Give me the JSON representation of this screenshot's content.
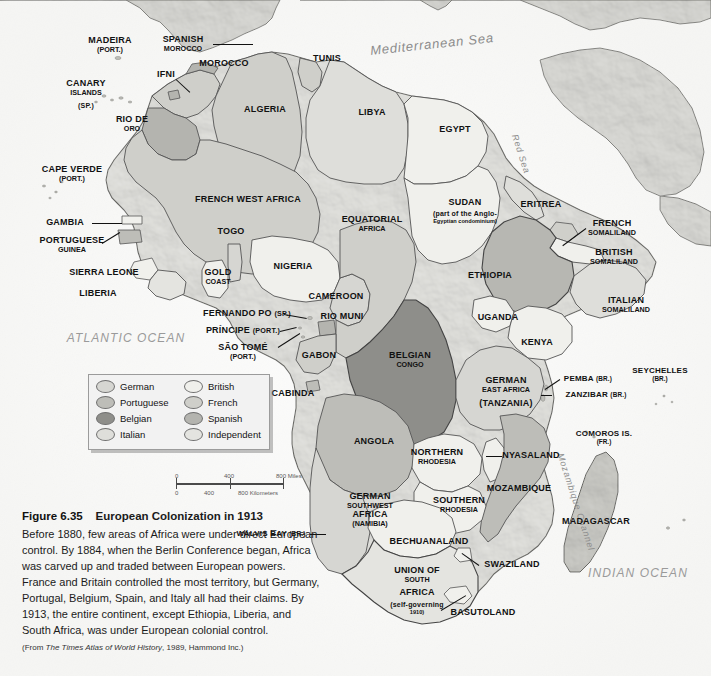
{
  "figure": {
    "number": "Figure 6.35",
    "title": "European Colonization in 1913",
    "body": "Before 1880, few areas of Africa were under direct European control. By 1884, when the Berlin Conference began, Africa was carved up and traded between European powers. France and Britain controlled the most territory, but Germany, Portugal, Belgium, Spain, and Italy all had their claims. By 1913, the entire continent, except Ethiopia, Liberia, and South Africa, was under European colonial control.",
    "source_prefix": "(From ",
    "source_italic": "The Times Atlas of World History",
    "source_suffix": ", 1989, Hammond Inc.)"
  },
  "legend": {
    "items": [
      {
        "label": "German",
        "color": "#d6d6d2"
      },
      {
        "label": "Portuguese",
        "color": "#bdbdb8"
      },
      {
        "label": "Belgian",
        "color": "#8e8e8a"
      },
      {
        "label": "Italian",
        "color": "#dedeDa"
      },
      {
        "label": "British",
        "color": "#f0f0ec"
      },
      {
        "label": "French",
        "color": "#cfcfca"
      },
      {
        "label": "Spanish",
        "color": "#b4b4af"
      },
      {
        "label": "Independent",
        "color": "#e4e4e0"
      }
    ]
  },
  "scalebar": {
    "miles": [
      "0",
      "400",
      "800 Miles"
    ],
    "kilometers": [
      "0",
      "400",
      "800 Kilometers"
    ]
  },
  "oceans": [
    {
      "name": "ATLANTIC OCEAN",
      "x": 126,
      "y": 338,
      "size": 12
    },
    {
      "name": "INDIAN OCEAN",
      "x": 638,
      "y": 573,
      "size": 12
    }
  ],
  "seas": [
    {
      "name": "Mediterranean Sea",
      "x": 432,
      "y": 44,
      "size": 13,
      "rot": -6
    },
    {
      "name": "Red Sea",
      "x": 521,
      "y": 154,
      "size": 9,
      "rot": 72
    },
    {
      "name": "Mozambique Channel",
      "x": 576,
      "y": 502,
      "size": 9,
      "rot": 72
    }
  ],
  "labels": [
    {
      "name": "MADEIRA",
      "sub": "(PORT.)",
      "x": 110,
      "y": 45,
      "size": 9
    },
    {
      "name": "SPANISH",
      "sub": "MOROCCO",
      "x": 183,
      "y": 44,
      "size": 9,
      "subbold": true
    },
    {
      "name": "MOROCCO",
      "x": 224,
      "y": 64,
      "size": 9
    },
    {
      "name": "IFNI",
      "x": 166,
      "y": 75,
      "size": 9
    },
    {
      "name": "CANARY",
      "sub": "ISLANDS",
      "x": 86,
      "y": 88,
      "size": 9,
      "subbold": true
    },
    {
      "name": "(SP.)",
      "x": 86,
      "y": 106,
      "size": 7
    },
    {
      "name": "TUNIS",
      "x": 327,
      "y": 59,
      "size": 9
    },
    {
      "name": "ALGERIA",
      "x": 265,
      "y": 110,
      "size": 9
    },
    {
      "name": "LIBYA",
      "x": 372,
      "y": 113,
      "size": 9
    },
    {
      "name": "EGYPT",
      "x": 455,
      "y": 130,
      "size": 9
    },
    {
      "name": "RIO DE",
      "sub": "ORO",
      "x": 132,
      "y": 124,
      "size": 9,
      "subbold": true
    },
    {
      "name": "CAPE VERDE",
      "sub": "(PORT.)",
      "x": 72,
      "y": 174,
      "size": 9
    },
    {
      "name": "FRENCH WEST AFRICA",
      "x": 248,
      "y": 200,
      "size": 9
    },
    {
      "name": "GAMBIA",
      "x": 65,
      "y": 223,
      "size": 9
    },
    {
      "name": "PORTUGUESE",
      "sub": "GUINEA",
      "x": 72,
      "y": 245,
      "size": 9,
      "subbold": true
    },
    {
      "name": "SIERRA LEONE",
      "x": 104,
      "y": 273,
      "size": 9
    },
    {
      "name": "LIBERIA",
      "x": 98,
      "y": 294,
      "size": 9
    },
    {
      "name": "TOGO",
      "x": 231,
      "y": 232,
      "size": 9
    },
    {
      "name": "GOLD",
      "sub": "COAST",
      "x": 218,
      "y": 277,
      "size": 9,
      "subbold": true
    },
    {
      "name": "NIGERIA",
      "x": 293,
      "y": 267,
      "size": 9
    },
    {
      "name": "EQUATORIAL",
      "sub": "AFRICA",
      "x": 372,
      "y": 224,
      "size": 9,
      "subbold": true
    },
    {
      "name": "CAMEROON",
      "x": 336,
      "y": 297,
      "size": 9
    },
    {
      "name": "FERNANDO PO",
      "paren": "(SP.)",
      "x": 247,
      "y": 314,
      "size": 9
    },
    {
      "name": "RIO MUNI",
      "x": 342,
      "y": 317,
      "size": 9
    },
    {
      "name": "PRÍNCIPE",
      "paren": "(PORT.)",
      "x": 243,
      "y": 331,
      "size": 9
    },
    {
      "name": "SÃO TOMÉ",
      "sub": "(PORT.)",
      "x": 243,
      "y": 352,
      "size": 9
    },
    {
      "name": "GABON",
      "x": 319,
      "y": 356,
      "size": 9
    },
    {
      "name": "SUDAN",
      "x": 465,
      "y": 203,
      "size": 9
    },
    {
      "name": "(part of the Anglo-",
      "sub": "Egyptian condominium)",
      "x": 465,
      "y": 217,
      "size": 7,
      "subbold": true
    },
    {
      "name": "ERITREA",
      "x": 541,
      "y": 205,
      "size": 9
    },
    {
      "name": "FRENCH",
      "sub": "SOMALILAND",
      "x": 612,
      "y": 228,
      "size": 9,
      "subbold": true
    },
    {
      "name": "BRITISH",
      "sub": "SOMALILAND",
      "x": 614,
      "y": 257,
      "size": 9,
      "subbold": true
    },
    {
      "name": "ETHIOPIA",
      "x": 490,
      "y": 276,
      "size": 9
    },
    {
      "name": "ITALIAN",
      "sub": "SOMALILAND",
      "x": 626,
      "y": 305,
      "size": 9,
      "subbold": true
    },
    {
      "name": "UGANDA",
      "x": 498,
      "y": 318,
      "size": 9
    },
    {
      "name": "KENYA",
      "x": 537,
      "y": 343,
      "size": 9
    },
    {
      "name": "BELGIAN",
      "sub": "CONGO",
      "x": 410,
      "y": 360,
      "size": 9,
      "subbold": true
    },
    {
      "name": "GERMAN",
      "sub": "EAST AFRICA",
      "x": 506,
      "y": 385,
      "size": 9,
      "subbold": true
    },
    {
      "name": "(TANZANIA)",
      "x": 506,
      "y": 404,
      "size": 9
    },
    {
      "name": "PEMBA",
      "paren": "(BR.)",
      "x": 588,
      "y": 379,
      "size": 8
    },
    {
      "name": "ZANZIBAR",
      "paren": "(BR.)",
      "x": 596,
      "y": 395,
      "size": 8
    },
    {
      "name": "SEYCHELLES",
      "sub": "(BR.)",
      "x": 660,
      "y": 375,
      "size": 8
    },
    {
      "name": "CABINDA",
      "x": 293,
      "y": 394,
      "size": 9
    },
    {
      "name": "ANGOLA",
      "x": 374,
      "y": 442,
      "size": 9
    },
    {
      "name": "COMOROS IS.",
      "sub": "(FR.)",
      "x": 604,
      "y": 438,
      "size": 8
    },
    {
      "name": "NORTHERN",
      "sub": "RHODESIA",
      "x": 437,
      "y": 457,
      "size": 9,
      "subbold": true
    },
    {
      "name": "NYASALAND",
      "x": 531,
      "y": 456,
      "size": 9
    },
    {
      "name": "MOZAMBIQUE",
      "x": 519,
      "y": 489,
      "size": 9
    },
    {
      "name": "SOUTHERN",
      "sub": "RHODESIA",
      "x": 459,
      "y": 505,
      "size": 9,
      "subbold": true
    },
    {
      "name": "GERMAN",
      "sub": "SOUTHWEST",
      "x": 370,
      "y": 501,
      "size": 9,
      "subbold": true
    },
    {
      "name": "AFRICA",
      "sub": "(NAMIBIA)",
      "x": 370,
      "y": 519,
      "size": 9,
      "subbold": true
    },
    {
      "name": "MADAGASCAR",
      "x": 596,
      "y": 522,
      "size": 9
    },
    {
      "name": "WALVIS BAY",
      "paren": "(BR.)",
      "x": 271,
      "y": 534,
      "size": 8
    },
    {
      "name": "BECHUANALAND",
      "x": 429,
      "y": 542,
      "size": 9
    },
    {
      "name": "UNION OF",
      "sub": "SOUTH",
      "x": 417,
      "y": 575,
      "size": 9,
      "subbold": true
    },
    {
      "name": "AFRICA",
      "x": 417,
      "y": 593,
      "size": 9
    },
    {
      "name": "(self-governing",
      "sub": "1910)",
      "x": 417,
      "y": 608,
      "size": 7,
      "subbold": true
    },
    {
      "name": "SWAZILAND",
      "x": 512,
      "y": 565,
      "size": 9
    },
    {
      "name": "BASUTOLAND",
      "x": 483,
      "y": 613,
      "size": 9
    }
  ],
  "leaders": [
    {
      "x1": 213,
      "y1": 44,
      "x2": 253,
      "y2": 44
    },
    {
      "x1": 176,
      "y1": 79,
      "x2": 190,
      "y2": 92
    },
    {
      "x1": 92,
      "y1": 223,
      "x2": 122,
      "y2": 223
    },
    {
      "x1": 102,
      "y1": 243,
      "x2": 120,
      "y2": 232
    },
    {
      "x1": 284,
      "y1": 314,
      "x2": 307,
      "y2": 318
    },
    {
      "x1": 280,
      "y1": 331,
      "x2": 297,
      "y2": 327
    },
    {
      "x1": 278,
      "y1": 347,
      "x2": 300,
      "y2": 333
    },
    {
      "x1": 560,
      "y1": 379,
      "x2": 545,
      "y2": 389
    },
    {
      "x1": 552,
      "y1": 395,
      "x2": 541,
      "y2": 395
    },
    {
      "x1": 586,
      "y1": 228,
      "x2": 563,
      "y2": 245
    },
    {
      "x1": 502,
      "y1": 456,
      "x2": 486,
      "y2": 456
    },
    {
      "x1": 310,
      "y1": 534,
      "x2": 326,
      "y2": 534
    },
    {
      "x1": 479,
      "y1": 565,
      "x2": 462,
      "y2": 553
    },
    {
      "x1": 441,
      "y1": 610,
      "x2": 466,
      "y2": 595
    }
  ]
}
